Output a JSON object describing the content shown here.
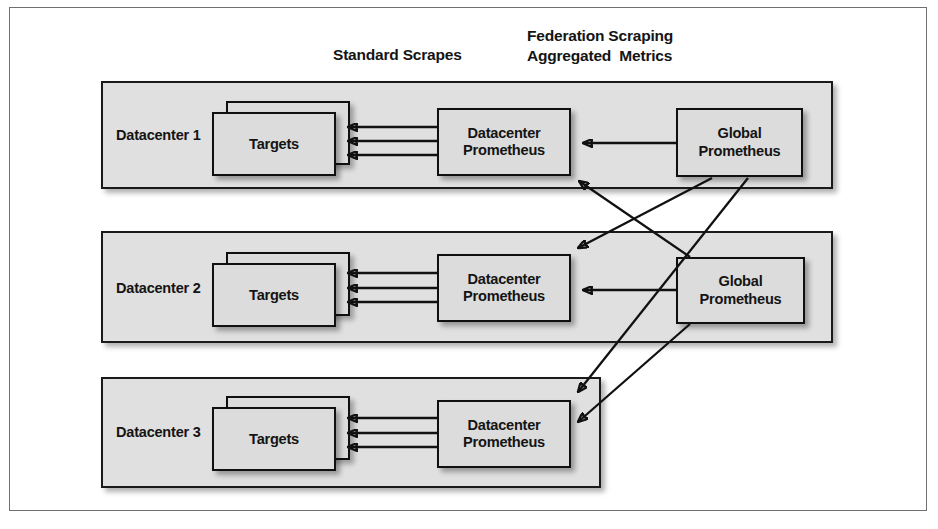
{
  "figure": {
    "background_color": "#ffffff",
    "border_color": "#6f6f6f"
  },
  "captions": {
    "standard_scrapes": "Standard Scrapes",
    "federation": "Federation Scraping\nAggregated  Metrics"
  },
  "datacenters": [
    {
      "label": "Datacenter 1",
      "targets_label": "Targets",
      "prometheus_label": "Datacenter\nPrometheus",
      "scrape_arrow_count": 3
    },
    {
      "label": "Datacenter 2",
      "targets_label": "Targets",
      "prometheus_label": "Datacenter\nPrometheus",
      "scrape_arrow_count": 3
    },
    {
      "label": "Datacenter 3",
      "targets_label": "Targets",
      "prometheus_label": "Datacenter\nPrometheus",
      "scrape_arrow_count": 3
    }
  ],
  "global_prometheus": [
    {
      "label": "Global\nPrometheus"
    },
    {
      "label": "Global\nPrometheus"
    }
  ],
  "colors": {
    "node_fill": "#dcdcdc",
    "container_fill": "#e0e0e0",
    "stroke": "#111111",
    "text": "#141414"
  },
  "edges": {
    "scrape_note": "Datacenter Prometheus scrapes its Targets (3 arrows each, pointing left into Targets)",
    "federation_note": "Each Global Prometheus federates from all three Datacenter Prometheus servers"
  }
}
